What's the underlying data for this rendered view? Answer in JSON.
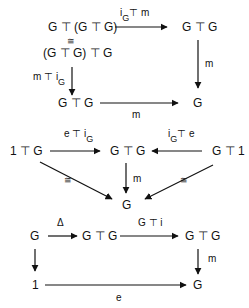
{
  "caption_fragment": "",
  "op": "⊤",
  "diagrams": {
    "associativity": {
      "nodes": {
        "top_left": "G ⊤ (G ⊤ G)",
        "iso": "≅",
        "mid_left": "(G ⊤ G) ⊤ G",
        "top_right": "G ⊤ G",
        "bottom_left": "G ⊤ G",
        "bottom_right": "G"
      },
      "labels": {
        "top_arrow_main": "i",
        "top_arrow_sub": "G",
        "top_arrow_rest": "⊤ m",
        "right_arrow": "m",
        "left_arrow_main": "m ⊤ i",
        "left_arrow_sub": "G",
        "bottom_arrow": "m"
      }
    },
    "unit": {
      "nodes": {
        "left": "1 ⊤ G",
        "center": "G ⊤ G",
        "right": "G ⊤ 1",
        "bottom": "G"
      },
      "labels": {
        "left_arrow_main": "e ⊤ i",
        "left_arrow_sub": "G",
        "right_arrow_main": "i",
        "right_arrow_sub": "G",
        "right_arrow_rest": "⊤ e",
        "down_arrow": "m",
        "left_diag": "≅",
        "right_diag": "≅"
      }
    },
    "inverse": {
      "nodes": {
        "top_left": "G",
        "top_mid": "G ⊤ G",
        "top_right": "G ⊤ G",
        "bottom_left": "1",
        "bottom_right": "G"
      },
      "labels": {
        "delta": "Δ",
        "g_tensor_i": "G ⊤ i",
        "right_arrow": "m",
        "bottom_arrow": "e"
      }
    }
  },
  "colors": {
    "ink": "#111111",
    "background": "#ffffff"
  }
}
